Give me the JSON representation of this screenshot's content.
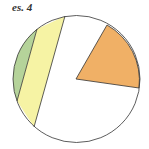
{
  "label": "es. 4",
  "colors": {
    "orange": "#f0b066",
    "yellow": "#f6f3a4",
    "green": "#b5d39a",
    "stroke": "#333333"
  }
}
